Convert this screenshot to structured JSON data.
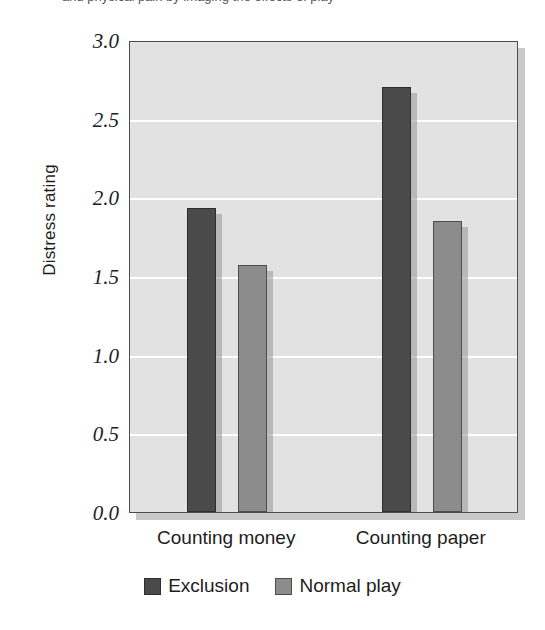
{
  "caption": {
    "partial_text": "and physical pain by imaging the effects of play"
  },
  "chart_data": {
    "type": "bar",
    "title": "",
    "subtitle": "",
    "xlabel": "",
    "ylabel": "Distress rating",
    "categories": [
      "Counting money",
      "Counting paper"
    ],
    "series": [
      {
        "name": "Exclusion",
        "color": "#4a4a4a",
        "values": [
          1.93,
          2.7
        ]
      },
      {
        "name": "Normal play",
        "color": "#8c8c8c",
        "values": [
          1.57,
          1.85
        ]
      }
    ],
    "ylim": [
      0.0,
      3.0
    ],
    "ytick_labels": [
      "3.0",
      "2.5",
      "2.0",
      "1.5",
      "1.0",
      "0.5",
      "0.0"
    ],
    "ytick_values": [
      3.0,
      2.5,
      2.0,
      1.5,
      1.0,
      0.5,
      0.0
    ],
    "grid": true,
    "grid_color": "#ffffff",
    "plot_background": "#e2e2e2",
    "legend_position": "bottom"
  }
}
